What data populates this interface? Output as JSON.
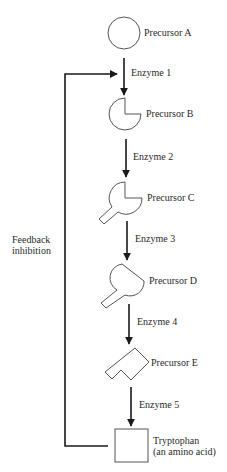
{
  "diagram": {
    "nodes": [
      {
        "id": "A",
        "label": "Precursor A",
        "shape": "circle"
      },
      {
        "id": "B",
        "label": "Precursor B",
        "shape": "circle-notch"
      },
      {
        "id": "C",
        "label": "Precursor C",
        "shape": "notched-with-stem"
      },
      {
        "id": "D",
        "label": "Precursor D",
        "shape": "rounded-with-stem"
      },
      {
        "id": "E",
        "label": "Precursor E",
        "shape": "chevron"
      },
      {
        "id": "T",
        "label_line1": "Tryptophan",
        "label_line2": "(an amino acid)",
        "shape": "square"
      }
    ],
    "enzymes": [
      "Enzyme 1",
      "Enzyme 2",
      "Enzyme 3",
      "Enzyme 4",
      "Enzyme 5"
    ],
    "feedback": {
      "label_line1": "Feedback",
      "label_line2": "inhibition",
      "from": "T",
      "to": "Enzyme 1"
    },
    "colors": {
      "line": "#1a1a1a",
      "shape_stroke": "#555555",
      "text": "#2a2a2a"
    }
  }
}
